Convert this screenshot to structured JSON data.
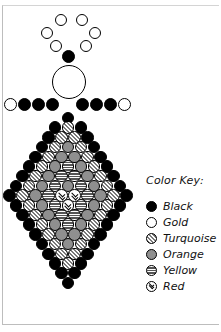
{
  "colors": {
    "black": "#000000",
    "gold": "#ffffff",
    "turquoise": "diagonal-stripe",
    "orange": "#8f8f8f",
    "yellow": "horizontal-stripe",
    "red": "chevron"
  },
  "pattern": {
    "halo": [
      {
        "x": 55,
        "y": 14,
        "d": 12,
        "color": "gold"
      },
      {
        "x": 76,
        "y": 14,
        "d": 12,
        "color": "gold"
      },
      {
        "x": 41,
        "y": 27,
        "d": 12,
        "color": "gold"
      },
      {
        "x": 89,
        "y": 27,
        "d": 12,
        "color": "gold"
      },
      {
        "x": 50,
        "y": 40,
        "d": 12,
        "color": "gold"
      },
      {
        "x": 80,
        "y": 40,
        "d": 12,
        "color": "gold"
      }
    ],
    "neck": {
      "x": 62,
      "y": 50,
      "d": 13,
      "color": "black"
    },
    "head": {
      "x": 52,
      "y": 65,
      "d": 34,
      "color": "gold"
    },
    "arms": [
      {
        "x": 4,
        "y": 98,
        "d": 13,
        "color": "gold"
      },
      {
        "x": 18,
        "y": 98,
        "d": 13,
        "color": "black"
      },
      {
        "x": 32,
        "y": 98,
        "d": 13,
        "color": "black"
      },
      {
        "x": 46,
        "y": 98,
        "d": 13,
        "color": "black"
      },
      {
        "x": 76,
        "y": 98,
        "d": 13,
        "color": "black"
      },
      {
        "x": 90,
        "y": 98,
        "d": 13,
        "color": "black"
      },
      {
        "x": 104,
        "y": 98,
        "d": 13,
        "color": "black"
      },
      {
        "x": 118,
        "y": 98,
        "d": 13,
        "color": "gold"
      }
    ],
    "body_center_x": 68,
    "body_top_y": 118,
    "body_row_spacing": 9.7,
    "body_bead_spacing": 13,
    "body_bead_d": 12.5,
    "body_rows": [
      [
        "black"
      ],
      [
        "black",
        "turquoise",
        "black"
      ],
      [
        "black",
        "turquoise",
        "turquoise",
        "black"
      ],
      [
        "black",
        "turquoise",
        "orange",
        "turquoise",
        "black"
      ],
      [
        "black",
        "turquoise",
        "orange",
        "orange",
        "turquoise",
        "black"
      ],
      [
        "black",
        "turquoise",
        "orange",
        "yellow",
        "orange",
        "turquoise",
        "black"
      ],
      [
        "black",
        "turquoise",
        "orange",
        "yellow",
        "yellow",
        "orange",
        "turquoise",
        "black"
      ],
      [
        "black",
        "turquoise",
        "orange",
        "yellow",
        "orange",
        "yellow",
        "orange",
        "turquoise",
        "black"
      ],
      [
        "black",
        "turquoise",
        "orange",
        "yellow",
        "red",
        "red",
        "yellow",
        "orange",
        "turquoise",
        "black"
      ],
      [
        "black",
        "turquoise",
        "orange",
        "yellow",
        "red",
        "yellow",
        "orange",
        "turquoise",
        "black"
      ],
      [
        "black",
        "turquoise",
        "orange",
        "yellow",
        "yellow",
        "orange",
        "turquoise",
        "black"
      ],
      [
        "black",
        "turquoise",
        "orange",
        "yellow",
        "orange",
        "turquoise",
        "black"
      ],
      [
        "black",
        "turquoise",
        "orange",
        "orange",
        "turquoise",
        "black"
      ],
      [
        "black",
        "turquoise",
        "orange",
        "turquoise",
        "black"
      ],
      [
        "black",
        "turquoise",
        "turquoise",
        "black"
      ],
      [
        "black",
        "turquoise",
        "black"
      ],
      [
        "black",
        "black"
      ],
      [
        "black"
      ]
    ]
  },
  "key": {
    "title": "Color Key:",
    "items": [
      {
        "color": "black",
        "label": "Black"
      },
      {
        "color": "gold",
        "label": "Gold"
      },
      {
        "color": "turquoise",
        "label": "Turquoise"
      },
      {
        "color": "orange",
        "label": "Orange"
      },
      {
        "color": "yellow",
        "label": "Yellow"
      },
      {
        "color": "red",
        "label": "Red"
      }
    ]
  }
}
